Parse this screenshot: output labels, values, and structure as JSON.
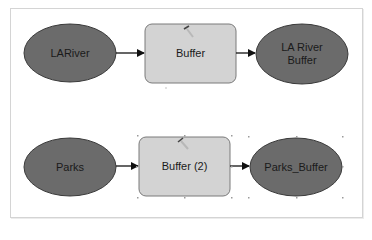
{
  "colors": {
    "data_fill": "#6b6b6b",
    "data_stroke": "#3a3a3a",
    "tool_fill": "#d3d3d3",
    "tool_stroke": "#7a7a7a",
    "connector": "#111111",
    "frame_border": "#d4d4d4"
  },
  "diagram": {
    "rows": [
      {
        "input": {
          "label": "LARiver",
          "shape": "ellipse"
        },
        "tool": {
          "label": "Buffer",
          "shape": "rounded-rect",
          "icon": "hammer-icon"
        },
        "output": {
          "label": "LA River Buffer",
          "label_lines": [
            "LA River",
            "Buffer"
          ],
          "shape": "ellipse"
        },
        "selected": false
      },
      {
        "input": {
          "label": "Parks",
          "shape": "ellipse"
        },
        "tool": {
          "label": "Buffer (2)",
          "shape": "rounded-rect",
          "icon": "hammer-icon"
        },
        "output": {
          "label": "Parks_Buffer",
          "shape": "ellipse"
        },
        "selected": true
      }
    ]
  }
}
